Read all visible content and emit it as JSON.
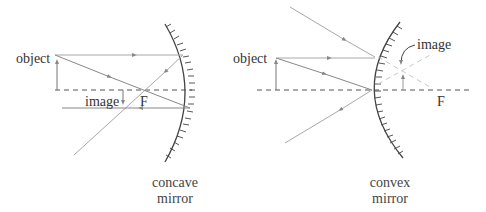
{
  "diagrams": [
    {
      "id": "concave",
      "labels": {
        "object": "object",
        "image": "image",
        "focal": "F"
      },
      "caption": [
        "concave",
        "mirror"
      ]
    },
    {
      "id": "convex",
      "labels": {
        "object": "object",
        "image": "image",
        "focal": "F"
      },
      "caption": [
        "convex",
        "mirror"
      ]
    }
  ],
  "colors": {
    "ray": "#a8a8a8",
    "axis": "#555555",
    "mirror": "#444444",
    "virtual": "#c8c8c8"
  }
}
